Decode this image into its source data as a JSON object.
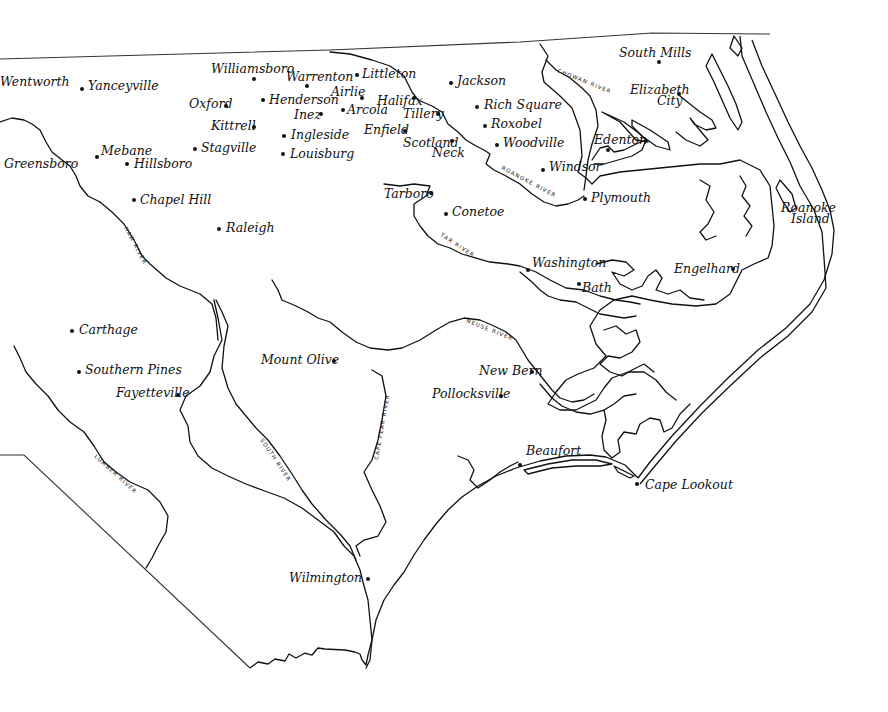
{
  "map": {
    "region": "Eastern North Carolina",
    "towns": [
      {
        "name": "Wentworth",
        "x": 50,
        "y": 83,
        "lx": 0,
        "ly": 86,
        "anchor": "start",
        "dot": false
      },
      {
        "name": "Yanceyville",
        "x": 82,
        "y": 89,
        "lx": 88,
        "ly": 90,
        "anchor": "start",
        "dot": true
      },
      {
        "name": "Williamsboro",
        "x": 254,
        "y": 79,
        "lx": 211,
        "ly": 73,
        "anchor": "start",
        "dot": true
      },
      {
        "name": "Warrenton",
        "x": 307,
        "y": 86,
        "lx": 286,
        "ly": 81,
        "anchor": "start",
        "dot": true
      },
      {
        "name": "Littleton",
        "x": 357,
        "y": 75,
        "lx": 362,
        "ly": 78,
        "anchor": "start",
        "dot": true
      },
      {
        "name": "Jackson",
        "x": 451,
        "y": 83,
        "lx": 457,
        "ly": 85,
        "anchor": "start",
        "dot": true
      },
      {
        "name": "South Mills",
        "x": 659,
        "y": 62,
        "lx": 619,
        "ly": 57,
        "anchor": "start",
        "dot": true
      },
      {
        "name": "Oxford",
        "x": 226,
        "y": 106,
        "lx": 189,
        "ly": 108,
        "anchor": "start",
        "dot": true
      },
      {
        "name": "Henderson",
        "x": 263,
        "y": 100,
        "lx": 269,
        "ly": 104,
        "anchor": "start",
        "dot": true
      },
      {
        "name": "Airlie",
        "x": 362,
        "y": 98,
        "lx": 331,
        "ly": 96,
        "anchor": "start",
        "dot": true
      },
      {
        "name": "Inez",
        "x": 321,
        "y": 114,
        "lx": 294,
        "ly": 119,
        "anchor": "start",
        "dot": true
      },
      {
        "name": "Arcola",
        "x": 343,
        "y": 110,
        "lx": 347,
        "ly": 114,
        "anchor": "start",
        "dot": true
      },
      {
        "name": "Halifax",
        "x": 414,
        "y": 98,
        "lx": 377,
        "ly": 105,
        "anchor": "start",
        "dot": true
      },
      {
        "name": "Tillery",
        "x": 438,
        "y": 114,
        "lx": 403,
        "ly": 118,
        "anchor": "start",
        "dot": true
      },
      {
        "name": "Rich Square",
        "x": 477,
        "y": 107,
        "lx": 484,
        "ly": 109,
        "anchor": "start",
        "dot": true
      },
      {
        "name": "Roxobel",
        "x": 485,
        "y": 126,
        "lx": 491,
        "ly": 128,
        "anchor": "start",
        "dot": true
      },
      {
        "name": "Elizabeth",
        "x": 679,
        "y": 94,
        "lx": 630,
        "ly": 94,
        "anchor": "start",
        "dot": true
      },
      {
        "name": "City",
        "x": 0,
        "y": 0,
        "lx": 657,
        "ly": 105,
        "anchor": "start",
        "dot": false
      },
      {
        "name": "Kittrell",
        "x": 254,
        "y": 127,
        "lx": 211,
        "ly": 130,
        "anchor": "start",
        "dot": true
      },
      {
        "name": "Ingleside",
        "x": 284,
        "y": 136,
        "lx": 291,
        "ly": 139,
        "anchor": "start",
        "dot": true
      },
      {
        "name": "Enfield",
        "x": 405,
        "y": 131,
        "lx": 364,
        "ly": 134,
        "anchor": "start",
        "dot": true
      },
      {
        "name": "Scotland",
        "x": 452,
        "y": 141,
        "lx": 403,
        "ly": 147,
        "anchor": "start",
        "dot": true
      },
      {
        "name": "Neck",
        "x": 0,
        "y": 0,
        "lx": 432,
        "ly": 157,
        "anchor": "start",
        "dot": false
      },
      {
        "name": "Woodville",
        "x": 497,
        "y": 145,
        "lx": 503,
        "ly": 147,
        "anchor": "start",
        "dot": true
      },
      {
        "name": "Edenton",
        "x": 608,
        "y": 150,
        "lx": 594,
        "ly": 144,
        "anchor": "start",
        "dot": true
      },
      {
        "name": "Stagville",
        "x": 195,
        "y": 149,
        "lx": 201,
        "ly": 152,
        "anchor": "start",
        "dot": true
      },
      {
        "name": "Louisburg",
        "x": 283,
        "y": 154,
        "lx": 290,
        "ly": 158,
        "anchor": "start",
        "dot": true
      },
      {
        "name": "Mebane",
        "x": 97,
        "y": 157,
        "lx": 101,
        "ly": 155,
        "anchor": "start",
        "dot": true
      },
      {
        "name": "Hillsboro",
        "x": 127,
        "y": 164,
        "lx": 134,
        "ly": 168,
        "anchor": "start",
        "dot": true
      },
      {
        "name": "Greensboro",
        "x": 0,
        "y": 0,
        "lx": 4,
        "ly": 168,
        "anchor": "start",
        "dot": false
      },
      {
        "name": "Windsor",
        "x": 543,
        "y": 170,
        "lx": 549,
        "ly": 171,
        "anchor": "start",
        "dot": true
      },
      {
        "name": "Tarboro",
        "x": 431,
        "y": 193,
        "lx": 384,
        "ly": 198,
        "anchor": "start",
        "dot": true
      },
      {
        "name": "Plymouth",
        "x": 585,
        "y": 199,
        "lx": 591,
        "ly": 202,
        "anchor": "start",
        "dot": true
      },
      {
        "name": "Roanoke",
        "x": 0,
        "y": 0,
        "lx": 781,
        "ly": 212,
        "anchor": "start",
        "dot": false
      },
      {
        "name": "Island",
        "x": 0,
        "y": 0,
        "lx": 791,
        "ly": 223,
        "anchor": "start",
        "dot": false
      },
      {
        "name": "Chapel Hill",
        "x": 134,
        "y": 200,
        "lx": 140,
        "ly": 204,
        "anchor": "start",
        "dot": true
      },
      {
        "name": "Conetoe",
        "x": 446,
        "y": 214,
        "lx": 452,
        "ly": 216,
        "anchor": "start",
        "dot": true
      },
      {
        "name": "Raleigh",
        "x": 219,
        "y": 229,
        "lx": 226,
        "ly": 232,
        "anchor": "start",
        "dot": true
      },
      {
        "name": "Washington",
        "x": 528,
        "y": 270,
        "lx": 532,
        "ly": 267,
        "anchor": "start",
        "dot": true
      },
      {
        "name": "Engelhard",
        "x": 733,
        "y": 269,
        "lx": 674,
        "ly": 273,
        "anchor": "start",
        "dot": true
      },
      {
        "name": "Bath",
        "x": 579,
        "y": 284,
        "lx": 582,
        "ly": 292,
        "anchor": "start",
        "dot": true
      },
      {
        "name": "Carthage",
        "x": 72,
        "y": 331,
        "lx": 79,
        "ly": 334,
        "anchor": "start",
        "dot": true
      },
      {
        "name": "Mount Olive",
        "x": 334,
        "y": 361,
        "lx": 261,
        "ly": 364,
        "anchor": "start",
        "dot": true
      },
      {
        "name": "New Bern",
        "x": 532,
        "y": 372,
        "lx": 479,
        "ly": 375,
        "anchor": "start",
        "dot": true
      },
      {
        "name": "Southern Pines",
        "x": 79,
        "y": 372,
        "lx": 85,
        "ly": 374,
        "anchor": "start",
        "dot": true
      },
      {
        "name": "Fayetteville",
        "x": 178,
        "y": 395,
        "lx": 116,
        "ly": 397,
        "anchor": "start",
        "dot": true
      },
      {
        "name": "Pollocksville",
        "x": 501,
        "y": 396,
        "lx": 432,
        "ly": 398,
        "anchor": "start",
        "dot": true
      },
      {
        "name": "Beaufort",
        "x": 520,
        "y": 465,
        "lx": 526,
        "ly": 455,
        "anchor": "start",
        "dot": true
      },
      {
        "name": "Cape Lookout",
        "x": 637,
        "y": 484,
        "lx": 645,
        "ly": 489,
        "anchor": "start",
        "dot": true
      },
      {
        "name": "Wilmington",
        "x": 368,
        "y": 579,
        "lx": 289,
        "ly": 582,
        "anchor": "start",
        "dot": true
      }
    ],
    "rivers": [
      {
        "name": "HAW RIVER",
        "x": 124,
        "y": 228,
        "rotate": 62
      },
      {
        "name": "TAR RIVER",
        "x": 440,
        "y": 236,
        "rotate": 33
      },
      {
        "name": "ROANOKE RIVER",
        "x": 501,
        "y": 169,
        "rotate": 28
      },
      {
        "name": "CHOWAN RIVER",
        "x": 557,
        "y": 72,
        "rotate": 22
      },
      {
        "name": "NEUSE RIVER",
        "x": 466,
        "y": 322,
        "rotate": 22
      },
      {
        "name": "SOUTH RIVER",
        "x": 260,
        "y": 440,
        "rotate": 56
      },
      {
        "name": "CAPE FEAR RIVER",
        "x": 378,
        "y": 460,
        "rotate": -80
      },
      {
        "name": "LUMBER RIVER",
        "x": 94,
        "y": 457,
        "rotate": 42
      }
    ]
  }
}
